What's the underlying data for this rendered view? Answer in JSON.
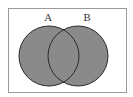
{
  "diagram": {
    "type": "venn",
    "sets": [
      {
        "label": "A",
        "fill": "#8a8a8a"
      },
      {
        "label": "B",
        "fill": "#8a8a8a"
      }
    ],
    "outline_color": "#2a2a2a",
    "frame_color": "#9a9a9a"
  }
}
